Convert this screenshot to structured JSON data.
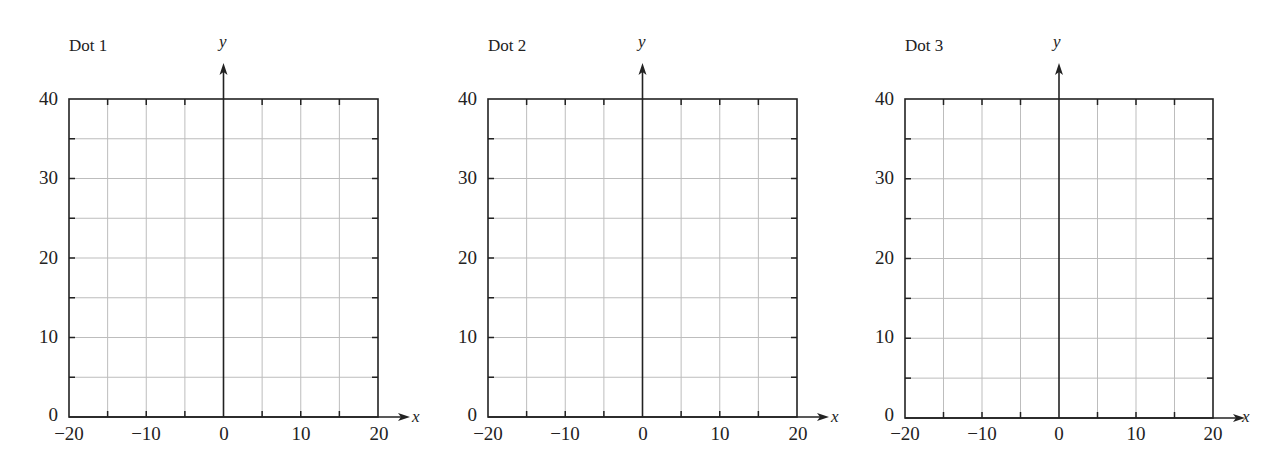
{
  "chart_data": [
    {
      "type": "scatter",
      "title": "Dot 1",
      "xlabel": "x",
      "ylabel": "y",
      "xlim": [
        -20,
        20
      ],
      "ylim": [
        0,
        40
      ],
      "x_ticks": [
        "−20",
        "−10",
        "0",
        "10",
        "20"
      ],
      "y_ticks": [
        "0",
        "10",
        "20",
        "30",
        "40"
      ],
      "grid": true,
      "grid_step_x": 5,
      "grid_step_y": 5,
      "points": []
    },
    {
      "type": "scatter",
      "title": "Dot 2",
      "xlabel": "x",
      "ylabel": "y",
      "xlim": [
        -20,
        20
      ],
      "ylim": [
        0,
        40
      ],
      "x_ticks": [
        "−20",
        "−10",
        "0",
        "10",
        "20"
      ],
      "y_ticks": [
        "0",
        "10",
        "20",
        "30",
        "40"
      ],
      "grid": true,
      "grid_step_x": 5,
      "grid_step_y": 5,
      "points": []
    },
    {
      "type": "scatter",
      "title": "Dot 3",
      "xlabel": "x",
      "ylabel": "y",
      "xlim": [
        -20,
        20
      ],
      "ylim": [
        0,
        40
      ],
      "x_ticks": [
        "−20",
        "−10",
        "0",
        "10",
        "20"
      ],
      "y_ticks": [
        "0",
        "10",
        "20",
        "30",
        "40"
      ],
      "grid": true,
      "grid_step_x": 5,
      "grid_step_y": 5,
      "points": []
    }
  ],
  "colors": {
    "axis": "#222222",
    "grid": "#bdbdbd",
    "background": "#ffffff"
  }
}
